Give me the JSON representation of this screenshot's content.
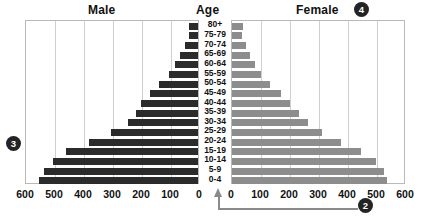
{
  "headings": {
    "male": "Male",
    "age": "Age",
    "female": "Female"
  },
  "callouts": [
    {
      "id": "callout-2",
      "label": "2"
    },
    {
      "id": "callout-3",
      "label": "3"
    },
    {
      "id": "callout-4",
      "label": "4"
    }
  ],
  "axis": {
    "left_ticks": [
      "600",
      "500",
      "400",
      "300",
      "200",
      "100",
      "0"
    ],
    "right_ticks": [
      "0",
      "100",
      "200",
      "300",
      "400",
      "500",
      "600"
    ],
    "min": 0,
    "max": 600,
    "step": 100
  },
  "colors": {
    "male_bar": "#2b2b2b",
    "female_bar": "#8d8d8d",
    "grid": "#cfcfcf",
    "frame": "#b9b9b9",
    "callout": "#242424",
    "text": "#111111"
  },
  "chart_data": {
    "type": "bar",
    "subtype": "population-pyramid",
    "title": "",
    "xlabel": "",
    "ylabel": "Age",
    "xlim": [
      0,
      600
    ],
    "grid": true,
    "legend": "none",
    "orientation": "horizontal-diverging",
    "categories": [
      "80+",
      "75-79",
      "70-74",
      "65-69",
      "60-64",
      "55-59",
      "50-54",
      "45-49",
      "40-44",
      "35-39",
      "30-34",
      "25-29",
      "20-24",
      "15-19",
      "10-14",
      "5-9",
      "0-4"
    ],
    "series": [
      {
        "name": "Male",
        "side": "left",
        "values": [
          30,
          32,
          45,
          62,
          78,
          100,
          135,
          165,
          198,
          215,
          240,
          300,
          375,
          455,
          500,
          530,
          550
        ]
      },
      {
        "name": "Female",
        "side": "right",
        "values": [
          38,
          35,
          48,
          62,
          78,
          100,
          132,
          168,
          200,
          230,
          262,
          312,
          375,
          445,
          498,
          525,
          535
        ]
      }
    ]
  }
}
